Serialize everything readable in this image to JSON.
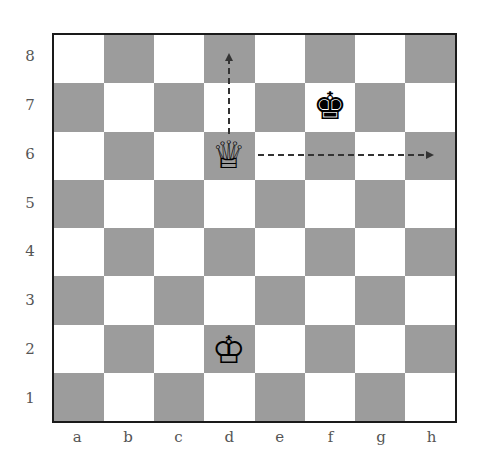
{
  "diagram": {
    "type": "chess-board",
    "files": [
      "a",
      "b",
      "c",
      "d",
      "e",
      "f",
      "g",
      "h"
    ],
    "ranks": [
      "8",
      "7",
      "6",
      "5",
      "4",
      "3",
      "2",
      "1"
    ],
    "colors": {
      "light_square": "#ffffff",
      "dark_square": "#9c9c9c",
      "border": "#1a1a1a",
      "arrow": "#333333"
    },
    "pieces": [
      {
        "name": "white-queen",
        "glyph": "♕",
        "square": "d6"
      },
      {
        "name": "black-king",
        "glyph": "♚",
        "square": "f7"
      },
      {
        "name": "white-king",
        "glyph": "♔",
        "square": "d2"
      }
    ],
    "arrows": [
      {
        "name": "queen-vertical-arrow",
        "from": "d6",
        "to": "d8",
        "style": "dashed"
      },
      {
        "name": "queen-horizontal-arrow",
        "from": "d6",
        "to": "h6",
        "style": "dashed"
      }
    ]
  }
}
